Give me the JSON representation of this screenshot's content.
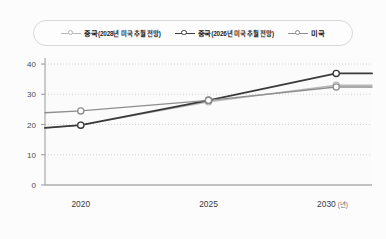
{
  "chart_data": {
    "type": "line",
    "title": "",
    "xlabel": "년",
    "ylabel": "",
    "x": [
      2020,
      2025,
      2030
    ],
    "xlim": [
      2018.6,
      2031.4
    ],
    "ylim": [
      0,
      42
    ],
    "yticks": [
      0,
      10,
      20,
      30,
      40
    ],
    "xticks": [
      "2020",
      "2025",
      "2030"
    ],
    "x_unit": "(년)",
    "grid": true,
    "legend_position": "top-center",
    "series": [
      {
        "name": "중국(2028년 미국 추월 전망)",
        "color": "#b7b7b7",
        "values": [
          19.8,
          27.5,
          33.0
        ],
        "edge_start": 18.9,
        "edge_end": 33.0
      },
      {
        "name": "중국(2026년 미국 추월 전망)",
        "color": "#3a3a3a",
        "values": [
          19.8,
          28.0,
          36.9
        ],
        "edge_start": 18.9,
        "edge_end": 36.9
      },
      {
        "name": "미국",
        "color": "#8e8e8e",
        "values": [
          24.5,
          28.0,
          32.4
        ],
        "edge_start": 23.9,
        "edge_end": 32.4
      }
    ]
  },
  "legend": {
    "items": [
      {
        "label_main": "중국",
        "label_paren": "(2028년 미국 추월 전망)",
        "marker": "open-circle-line",
        "color": "#b7b7b7"
      },
      {
        "label_main": "중국",
        "label_paren": "(2026년 미국 추월 전망)",
        "marker": "open-circle-line",
        "color": "#3a3a3a"
      },
      {
        "label_main": "미국",
        "label_paren": "",
        "marker": "open-circle-line",
        "color": "#8e8e8e"
      }
    ]
  },
  "axis": {
    "y_tick_labels": [
      "40",
      "30",
      "20",
      "10",
      "0"
    ],
    "x_tick_labels": [
      "2020",
      "2025",
      "2030"
    ],
    "x_unit_label": "(년)"
  },
  "colors": {
    "background": "#fcfcfc",
    "plot_background": "#fbfbfb",
    "grid": "#c9c9d4",
    "axis": "#9a9a9a",
    "text": "#3a3a3a"
  }
}
